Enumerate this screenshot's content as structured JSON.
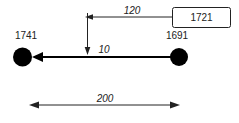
{
  "diagram": {
    "colors": {
      "ink": "#222222",
      "node_fill": "#000000",
      "background": "#ffffff"
    },
    "nodes": [
      {
        "label": "1741"
      },
      {
        "label": "1691"
      }
    ],
    "value_box": {
      "label": "1721"
    },
    "dimensions": {
      "top_offset": "120",
      "line_offset": "10",
      "span": "200"
    }
  }
}
